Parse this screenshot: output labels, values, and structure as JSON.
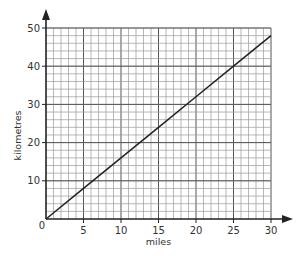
{
  "chart_data": {
    "type": "line",
    "title": "",
    "xlabel": "miles",
    "ylabel": "kilometres",
    "xlim": [
      0,
      30
    ],
    "ylim": [
      0,
      50
    ],
    "x_ticks": [
      0,
      5,
      10,
      15,
      20,
      25,
      30
    ],
    "y_ticks": [
      10,
      20,
      30,
      40,
      50
    ],
    "origin_label": "0",
    "grid": true,
    "grid_minor_x_step": 1,
    "grid_minor_y_step": 2,
    "grid_major_step": 5,
    "legend": null,
    "series": [
      {
        "name": "miles to kilometres conversion",
        "x": [
          0,
          5,
          10,
          15,
          20,
          25,
          30
        ],
        "y": [
          0,
          8,
          16,
          24,
          32,
          40,
          48
        ]
      }
    ]
  },
  "colors": {
    "line": "#222222",
    "axis": "#222222",
    "grid_minor": "#9a9a9a",
    "grid_major": "#555555",
    "text": "#333333"
  }
}
